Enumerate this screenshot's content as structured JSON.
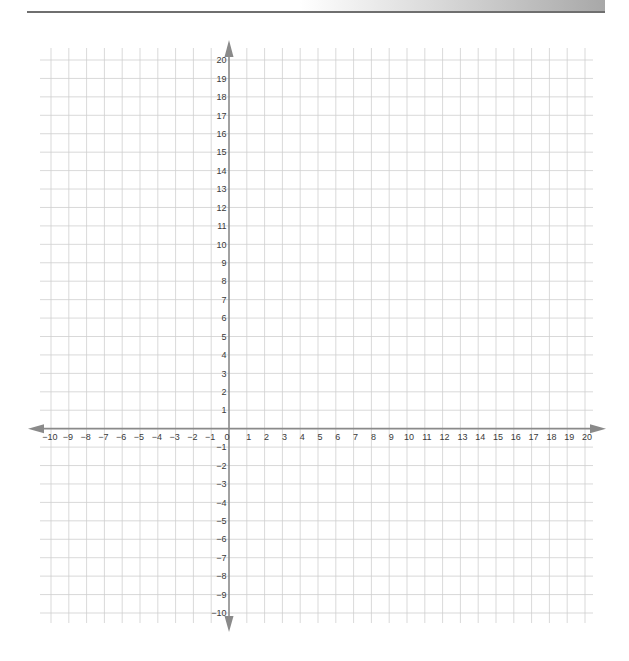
{
  "page": {
    "header_band_present": true
  },
  "chart_data": {
    "type": "scatter",
    "title": "",
    "xlabel": "",
    "ylabel": "",
    "xlim": [
      -10,
      20
    ],
    "ylim": [
      -10,
      20
    ],
    "grid": true,
    "x_ticks": [
      -10,
      -9,
      -8,
      -7,
      -6,
      -5,
      -4,
      -3,
      -2,
      -1,
      0,
      1,
      2,
      3,
      4,
      5,
      6,
      7,
      8,
      9,
      10,
      11,
      12,
      13,
      14,
      15,
      16,
      17,
      18,
      19,
      20
    ],
    "y_ticks": [
      20,
      19,
      18,
      17,
      16,
      15,
      14,
      13,
      12,
      11,
      10,
      9,
      8,
      7,
      6,
      5,
      4,
      3,
      2,
      1,
      -1,
      -2,
      -3,
      -4,
      -5,
      -6,
      -7,
      -8,
      -9,
      -10
    ],
    "x_tick_labels": [
      "−10",
      "−9",
      "−8",
      "−7",
      "−6",
      "−5",
      "−4",
      "−3",
      "−2",
      "−1",
      "0",
      "1",
      "2",
      "3",
      "4",
      "5",
      "6",
      "7",
      "8",
      "9",
      "10",
      "11",
      "12",
      "13",
      "14",
      "15",
      "16",
      "17",
      "18",
      "19",
      "20"
    ],
    "y_tick_labels": [
      "20",
      "19",
      "18",
      "17",
      "16",
      "15",
      "14",
      "13",
      "12",
      "11",
      "10",
      "9",
      "8",
      "7",
      "6",
      "5",
      "4",
      "3",
      "2",
      "1",
      "−1",
      "−2",
      "−3",
      "−4",
      "−5",
      "−6",
      "−7",
      "−8",
      "−9",
      "−10"
    ],
    "series": [],
    "legend": null
  },
  "colors": {
    "grid": "#cfcfcf",
    "axis": "#8a8a8a",
    "label": "#3a3a3a"
  }
}
